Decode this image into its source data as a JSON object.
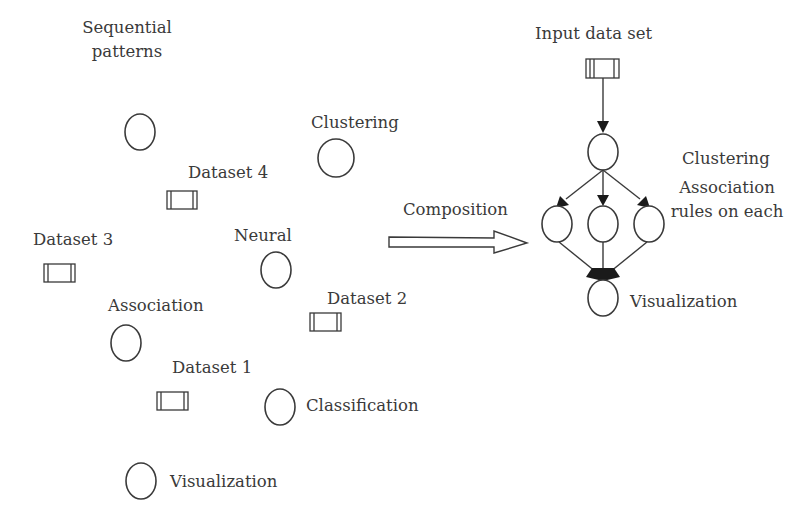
{
  "left_panel": {
    "labels": {
      "sequential_patterns": "Sequential\npatterns",
      "clustering": "Clustering",
      "dataset4": "Dataset 4",
      "dataset3": "Dataset 3",
      "neural": "Neural",
      "association": "Association",
      "dataset2": "Dataset 2",
      "dataset1": "Dataset 1",
      "classification": "Classification",
      "visualization": "Visualization"
    }
  },
  "composition": {
    "label": "Composition"
  },
  "right_panel": {
    "input_label": "Input data set",
    "clustering_label": "Clustering",
    "association_label": "Association\nrules on each",
    "visualization_label": "Visualization"
  },
  "colors": {
    "stroke": "#3a3a3a",
    "text": "#3a3a3a",
    "background": "#ffffff"
  }
}
